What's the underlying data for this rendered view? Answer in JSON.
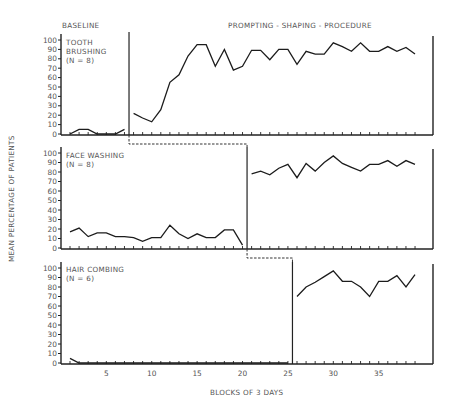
{
  "chart_data": {
    "type": "line",
    "layout": "three stacked panels (multiple-baseline design)",
    "phase_labels": [
      "BASELINE",
      "PROMPTING - SHAPING - PROCEDURE"
    ],
    "xlabel": "BLOCKS OF 3 DAYS",
    "ylabel": "MEAN PERCENTAGE OF PATIENTS",
    "x_ticks": [
      5,
      10,
      15,
      20,
      25,
      30,
      35
    ],
    "x_range": [
      1,
      39
    ],
    "y_ticks": [
      0,
      10,
      20,
      30,
      40,
      50,
      60,
      70,
      80,
      90,
      100
    ],
    "ylim": [
      0,
      100
    ],
    "grid": false,
    "panels": [
      {
        "title": "TOOTH BRUSHING",
        "n_label": "(N = 8)",
        "phase_change_after_block": 7,
        "baseline": {
          "x": [
            1,
            2,
            3,
            4,
            5,
            6,
            7
          ],
          "y": [
            0,
            5,
            5,
            0,
            0,
            0,
            5
          ]
        },
        "treatment": {
          "x": [
            8,
            9,
            10,
            11,
            12,
            13,
            14,
            15,
            16,
            17,
            18,
            19,
            20,
            21,
            22,
            23,
            24,
            25,
            26,
            27,
            28,
            29,
            30,
            31,
            32,
            33,
            34,
            35,
            36,
            37,
            38,
            39
          ],
          "y": [
            22,
            17,
            13,
            26,
            55,
            63,
            83,
            95,
            95,
            72,
            90,
            68,
            72,
            89,
            89,
            79,
            90,
            90,
            74,
            88,
            85,
            85,
            97,
            93,
            88,
            97,
            88,
            88,
            93,
            88,
            92,
            85
          ]
        }
      },
      {
        "title": "FACE WASHING",
        "n_label": "(N = 8)",
        "phase_change_after_block": 20,
        "baseline": {
          "x": [
            1,
            2,
            3,
            4,
            5,
            6,
            7,
            8,
            9,
            10,
            11,
            12,
            13,
            14,
            15,
            16,
            17,
            18,
            19,
            20
          ],
          "y": [
            17,
            21,
            12,
            16,
            16,
            12,
            12,
            11,
            7,
            11,
            11,
            24,
            15,
            10,
            15,
            11,
            11,
            19,
            19,
            3
          ]
        },
        "treatment": {
          "x": [
            21,
            22,
            23,
            24,
            25,
            26,
            27,
            28,
            29,
            30,
            31,
            32,
            33,
            34,
            35,
            36,
            37,
            38,
            39
          ],
          "y": [
            78,
            81,
            77,
            84,
            88,
            74,
            89,
            81,
            90,
            97,
            89,
            85,
            81,
            88,
            88,
            92,
            86,
            92,
            88
          ]
        }
      },
      {
        "title": "HAIR COMBING",
        "n_label": "(N = 6)",
        "phase_change_after_block": 25,
        "baseline": {
          "x": [
            1,
            2,
            3,
            4,
            5,
            6,
            7,
            8,
            9,
            10,
            11,
            12,
            13,
            14,
            15,
            16,
            17,
            18,
            19,
            20,
            21,
            22,
            23,
            24,
            25
          ],
          "y": [
            5,
            0,
            0,
            0,
            0,
            0,
            0,
            0,
            0,
            0,
            0,
            0,
            0,
            0,
            0,
            0,
            0,
            0,
            0,
            0,
            0,
            0,
            0,
            0,
            0
          ]
        },
        "treatment": {
          "x": [
            26,
            27,
            28,
            29,
            30,
            31,
            32,
            33,
            34,
            35,
            36,
            37,
            38,
            39
          ],
          "y": [
            70,
            80,
            85,
            91,
            97,
            86,
            86,
            80,
            70,
            86,
            86,
            92,
            80,
            93
          ]
        }
      }
    ]
  },
  "text": {
    "baseline_label": "BASELINE",
    "treatment_label": "PROMPTING - SHAPING - PROCEDURE",
    "xlabel": "BLOCKS OF 3 DAYS",
    "ylabel": "MEAN PERCENTAGE OF PATIENTS",
    "panel1_title_1": "TOOTH",
    "panel1_title_2": "BRUSHING",
    "panel1_n": "(N = 8)",
    "panel2_title": "FACE  WASHING",
    "panel2_n": "(N = 8)",
    "panel3_title": "HAIR  COMBING",
    "panel3_n": "(N = 6)"
  }
}
